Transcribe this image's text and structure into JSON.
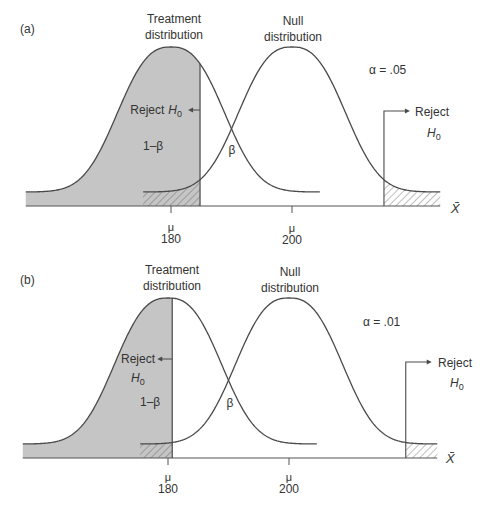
{
  "chart_data": [
    {
      "panel": "(a)",
      "type": "area",
      "title": "",
      "xlabel": "X̄",
      "ylabel": "",
      "xlim": [
        156,
        224.5
      ],
      "grid": false,
      "distributions": [
        {
          "key": "treatment",
          "label": [
            "Treatment",
            "distribution"
          ],
          "mean": 180
        },
        {
          "key": "null",
          "label": [
            "Null",
            "distribution"
          ],
          "mean": 200
        }
      ],
      "ticks": [
        {
          "symbol": "μ",
          "value": "180"
        },
        {
          "symbol": "μ",
          "value": "200"
        }
      ],
      "alpha": 0.05,
      "alpha_label": "α = .05",
      "critical_values": [
        184.8,
        215.2
      ],
      "annotations": {
        "reject_left": {
          "text": "Reject",
          "h": "H",
          "sub": "0"
        },
        "reject_right": {
          "text": "Reject",
          "h": "H",
          "sub": "0"
        },
        "power": "1–β",
        "beta": "β"
      }
    },
    {
      "panel": "(b)",
      "type": "area",
      "title": "",
      "xlabel": "X̄",
      "ylabel": "",
      "xlim": [
        156,
        224.5
      ],
      "grid": false,
      "distributions": [
        {
          "key": "treatment",
          "label": [
            "Treatment",
            "distribution"
          ],
          "mean": 180
        },
        {
          "key": "null",
          "label": [
            "Null",
            "distribution"
          ],
          "mean": 200
        }
      ],
      "ticks": [
        {
          "symbol": "μ",
          "value": "180"
        },
        {
          "symbol": "μ",
          "value": "200"
        }
      ],
      "alpha": 0.01,
      "alpha_label": "α = .01",
      "critical_values": [
        180.7,
        219.3
      ],
      "annotations": {
        "reject_left": {
          "text": "Reject",
          "h": "H",
          "sub": "0"
        },
        "reject_right": {
          "text": "Reject",
          "h": "H",
          "sub": "0"
        },
        "power": "1–β",
        "beta": "β"
      }
    }
  ],
  "colors": {
    "power_fill": "#c5c5c5",
    "curve_stroke": "#4a4a4a",
    "hatch_stroke": "#5a5a5a",
    "axis_stroke": "#555555"
  }
}
